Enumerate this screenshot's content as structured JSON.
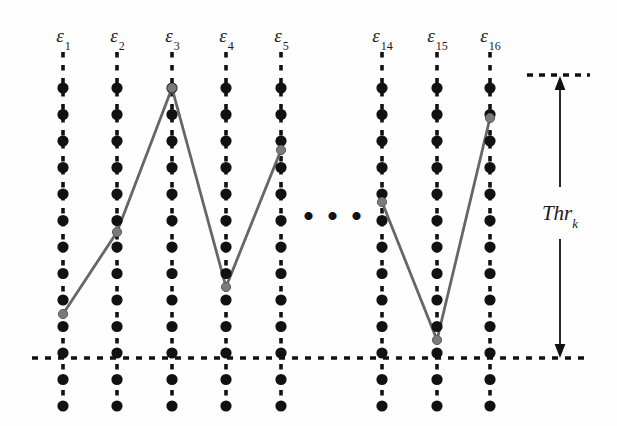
{
  "figure": {
    "background_color": "#fefefe",
    "dot_color": "#111111",
    "dash_color": "#111111",
    "polyline_color": "#666666",
    "width": 617,
    "height": 426
  },
  "ellipsis": {
    "text": "• • •",
    "x": 334,
    "y": 216
  },
  "threshold": {
    "label_main": "Thr",
    "label_sub": "k",
    "label_x": 560,
    "label_y": 215,
    "arrow_x": 560,
    "arrow_top_y": 76,
    "arrow_bottom_y": 358,
    "top_dash_x1": 527,
    "top_dash_x2": 590,
    "top_dash_y": 75
  },
  "baseline": {
    "name": "bottom-threshold-line",
    "y": 358,
    "x1": 32,
    "x2": 590
  },
  "columns": [
    {
      "id": "eps1",
      "label_main": "ε",
      "label_sub": "1",
      "x": 63,
      "label_y": 26,
      "top_y": 52,
      "bottom_y": 412
    },
    {
      "id": "eps2",
      "label_main": "ε",
      "label_sub": "2",
      "x": 117,
      "label_y": 26,
      "top_y": 52,
      "bottom_y": 412
    },
    {
      "id": "eps3",
      "label_main": "ε",
      "label_sub": "3",
      "x": 172,
      "label_y": 26,
      "top_y": 52,
      "bottom_y": 412
    },
    {
      "id": "eps4",
      "label_main": "ε",
      "label_sub": "4",
      "x": 226,
      "label_y": 26,
      "top_y": 52,
      "bottom_y": 412
    },
    {
      "id": "eps5",
      "label_main": "ε",
      "label_sub": "5",
      "x": 281,
      "label_y": 26,
      "top_y": 52,
      "bottom_y": 412
    },
    {
      "id": "eps14",
      "label_main": "ε",
      "label_sub": "14",
      "x": 382,
      "label_y": 26,
      "top_y": 52,
      "bottom_y": 412
    },
    {
      "id": "eps15",
      "label_main": "ε",
      "label_sub": "15",
      "x": 437,
      "label_y": 26,
      "top_y": 52,
      "bottom_y": 412
    },
    {
      "id": "eps16",
      "label_main": "ε",
      "label_sub": "16",
      "x": 490,
      "label_y": 26,
      "top_y": 52,
      "bottom_y": 412
    }
  ],
  "dots": {
    "first_y": 88,
    "spacing": 26.5,
    "count": 13,
    "radius": 5.6
  },
  "chart_data": {
    "type": "line",
    "xlabel": "",
    "ylabel": "",
    "categories": [
      "ε1",
      "ε2",
      "ε3",
      "ε4",
      "ε5",
      "ε14",
      "ε15",
      "ε16"
    ],
    "series": [
      {
        "name": "segment-left",
        "points": [
          {
            "category": "ε1",
            "x": 63,
            "y": 314
          },
          {
            "category": "ε2",
            "x": 117,
            "y": 232
          },
          {
            "category": "ε3",
            "x": 172,
            "y": 88
          },
          {
            "category": "ε4",
            "x": 226,
            "y": 287
          },
          {
            "category": "ε5",
            "x": 281,
            "y": 150
          }
        ]
      },
      {
        "name": "segment-right",
        "points": [
          {
            "category": "ε14",
            "x": 382,
            "y": 202
          },
          {
            "category": "ε15",
            "x": 437,
            "y": 340
          },
          {
            "category": "ε16",
            "x": 490,
            "y": 118
          }
        ]
      }
    ],
    "annotations": [
      {
        "text": "Thr_k",
        "type": "double-arrow-span",
        "from_y": 75,
        "to_y": 358
      },
      {
        "text": "• • •",
        "type": "ellipsis-gap",
        "x": 334,
        "y": 216
      }
    ],
    "grid": false,
    "legend": "none"
  }
}
